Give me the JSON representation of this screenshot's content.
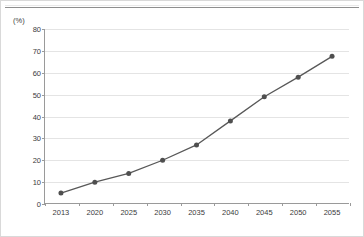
{
  "chart_data": {
    "type": "line",
    "title": "",
    "xlabel": "",
    "ylabel": "(%)",
    "unit_label": "(%)",
    "categories": [
      "2013",
      "2020",
      "2025",
      "2030",
      "2035",
      "2040",
      "2045",
      "2050",
      "2055"
    ],
    "values": [
      5,
      10,
      14,
      20,
      27,
      38,
      49,
      58,
      67.5
    ],
    "series": [
      {
        "name": "",
        "values": [
          5,
          10,
          14,
          20,
          27,
          38,
          49,
          58,
          67.5
        ]
      }
    ],
    "ylim": [
      0,
      80
    ],
    "yticks": [
      "0",
      "10",
      "20",
      "30",
      "40",
      "50",
      "60",
      "70",
      "80"
    ],
    "ytick_values": [
      0,
      10,
      20,
      30,
      40,
      50,
      60,
      70,
      80
    ],
    "grid": true,
    "legend": "none",
    "line_color": "#585858",
    "marker_color": "#4f4f4f",
    "gridline_color": "#e4e4e4",
    "axis_color": "#9a9a9a",
    "text_color": "#3b3b3b",
    "background": "#ffffff"
  }
}
